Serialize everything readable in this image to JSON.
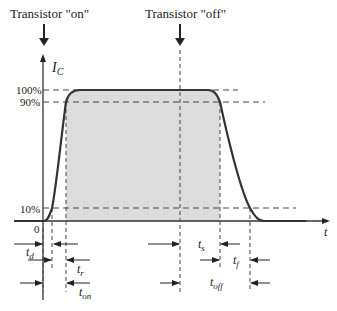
{
  "diagram": {
    "title_on": "Transistor \"on\"",
    "title_off": "Transistor \"off\"",
    "y_axis": {
      "symbol": "I",
      "subscript": "C"
    },
    "x_axis": {
      "symbol": "t",
      "origin_label": "0"
    },
    "levels": [
      {
        "name": "100%",
        "label": "100%"
      },
      {
        "name": "90%",
        "label": "90%"
      },
      {
        "name": "10%",
        "label": "10%"
      }
    ],
    "intervals": {
      "delay": {
        "symbol": "t",
        "subscript": "d"
      },
      "rise": {
        "symbol": "t",
        "subscript": "r"
      },
      "on": {
        "symbol": "t",
        "subscript": "on"
      },
      "storage": {
        "symbol": "t",
        "subscript": "s"
      },
      "fall": {
        "symbol": "t",
        "subscript": "f"
      },
      "off": {
        "symbol": "t",
        "subscript": "off"
      }
    },
    "colors": {
      "curve": "#333333",
      "fill": "#dcdcdc",
      "dash": "#444444",
      "text": "#222222"
    }
  }
}
